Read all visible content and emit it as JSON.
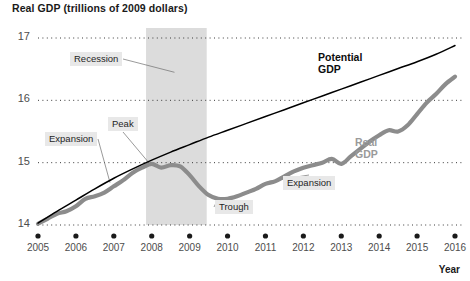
{
  "chart_data": {
    "type": "line",
    "title": "Real GDP (trillions of 2009 dollars)",
    "xlabel": "Year",
    "ylabel": "Real GDP (trillions of 2009 dollars)",
    "xlim": [
      2005,
      2016
    ],
    "ylim": [
      14,
      17
    ],
    "yticks": [
      "14",
      "15",
      "16",
      "17"
    ],
    "ytick_values": [
      14,
      15,
      16,
      17
    ],
    "categories": [
      "2005",
      "2006",
      "2007",
      "2008",
      "2009",
      "2010",
      "2011",
      "2012",
      "2013",
      "2014",
      "2015",
      "2016"
    ],
    "grid": "horizontal-dotted",
    "legend": "inline-labels",
    "series": [
      {
        "name": "Potential GDP",
        "color": "#000000",
        "style": "thin-solid-black",
        "x": [
          2005,
          2005.5,
          2006,
          2006.5,
          2007,
          2007.5,
          2008,
          2008.5,
          2009,
          2009.5,
          2010,
          2010.5,
          2011,
          2011.5,
          2012,
          2012.5,
          2013,
          2013.5,
          2014,
          2014.5,
          2015,
          2015.5,
          2016
        ],
        "values": [
          14.03,
          14.22,
          14.4,
          14.58,
          14.75,
          14.9,
          15.04,
          15.17,
          15.29,
          15.41,
          15.52,
          15.63,
          15.74,
          15.85,
          15.96,
          16.07,
          16.18,
          16.29,
          16.4,
          16.51,
          16.62,
          16.74,
          16.88
        ]
      },
      {
        "name": "Real GDP",
        "color": "#8c8c8c",
        "style": "thick-gray",
        "x": [
          2005,
          2005.25,
          2005.5,
          2005.75,
          2006,
          2006.25,
          2006.5,
          2006.75,
          2007,
          2007.25,
          2007.5,
          2007.75,
          2008,
          2008.25,
          2008.5,
          2008.75,
          2009,
          2009.25,
          2009.5,
          2009.75,
          2010,
          2010.25,
          2010.5,
          2010.75,
          2011,
          2011.25,
          2011.5,
          2011.75,
          2012,
          2012.25,
          2012.5,
          2012.75,
          2013,
          2013.25,
          2013.5,
          2013.75,
          2014,
          2014.25,
          2014.5,
          2014.75,
          2015,
          2015.25,
          2015.5,
          2015.75,
          2016
        ],
        "values": [
          14.02,
          14.1,
          14.18,
          14.22,
          14.3,
          14.42,
          14.46,
          14.52,
          14.62,
          14.72,
          14.84,
          14.92,
          14.98,
          14.92,
          14.96,
          14.94,
          14.8,
          14.62,
          14.48,
          14.42,
          14.42,
          14.46,
          14.52,
          14.58,
          14.66,
          14.7,
          14.78,
          14.86,
          14.92,
          14.96,
          15.0,
          15.06,
          14.98,
          15.1,
          15.22,
          15.34,
          15.44,
          15.52,
          15.5,
          15.6,
          15.78,
          15.96,
          16.1,
          16.26,
          16.38
        ]
      }
    ],
    "shaded_regions": [
      {
        "name": "Recession",
        "x_start": 2007.85,
        "x_end": 2009.45,
        "color": "#dcdcdc"
      }
    ],
    "annotations": [
      {
        "id": "recession",
        "label": "Recession",
        "target_x": 2008.6,
        "target_y": 16.45
      },
      {
        "id": "expansion-left",
        "label": "Expansion",
        "target_x": 2006.9,
        "target_y": 14.68
      },
      {
        "id": "peak",
        "label": "Peak",
        "target_x": 2007.95,
        "target_y": 14.98
      },
      {
        "id": "trough",
        "label": "Trough",
        "target_x": 2009.75,
        "target_y": 14.42
      },
      {
        "id": "expansion-right",
        "label": "Expansion",
        "target_x": 2011.1,
        "target_y": 14.7
      }
    ],
    "series_labels": [
      {
        "name": "Potential GDP",
        "line1": "Potential",
        "line2": "GDP",
        "color": "#0d0d0d"
      },
      {
        "name": "Real GDP",
        "line1": "Real",
        "line2": "GDP",
        "color": "#9a9a9a"
      }
    ]
  }
}
